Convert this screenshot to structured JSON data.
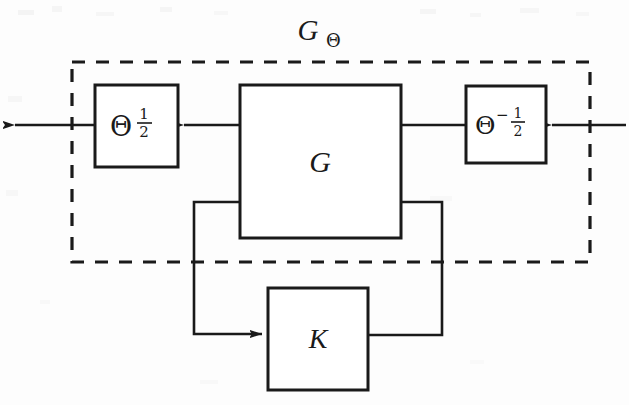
{
  "figure": {
    "kind": "control-block-diagram",
    "background_color": "#fdfdfd",
    "line_color": "#1a1a1a",
    "outer_group_label": {
      "base": "G",
      "subscript": "Θ",
      "full": "GΘ"
    },
    "blocks": [
      {
        "id": "theta-half",
        "label_base": "Θ",
        "label_exponent_numerator": "1",
        "label_exponent_denominator": "2",
        "label_exponent_sign": "",
        "full_label": "Θ^(1/2)"
      },
      {
        "id": "plant-g",
        "label_base": "G",
        "full_label": "G"
      },
      {
        "id": "theta-neg-half",
        "label_base": "Θ",
        "label_exponent_numerator": "1",
        "label_exponent_denominator": "2",
        "label_exponent_sign": "−",
        "full_label": "Θ^(−1/2)"
      },
      {
        "id": "controller-k",
        "label_base": "K",
        "full_label": "K"
      }
    ],
    "signals": [
      {
        "id": "external-input",
        "direction": "right-to-left",
        "enters": "theta-neg-half"
      },
      {
        "id": "scaled-input",
        "direction": "right-to-left",
        "enters": "plant-g"
      },
      {
        "id": "plant-output",
        "direction": "right-to-left",
        "enters": "theta-half"
      },
      {
        "id": "external-output",
        "direction": "right-to-left",
        "enters": "environment"
      },
      {
        "id": "measurement",
        "direction": "g-to-k",
        "enters": "controller-k"
      },
      {
        "id": "control-action",
        "direction": "k-to-g",
        "enters": "plant-g"
      }
    ],
    "dashed_boundary": {
      "style": "dashed",
      "encloses": "GΘ"
    }
  }
}
